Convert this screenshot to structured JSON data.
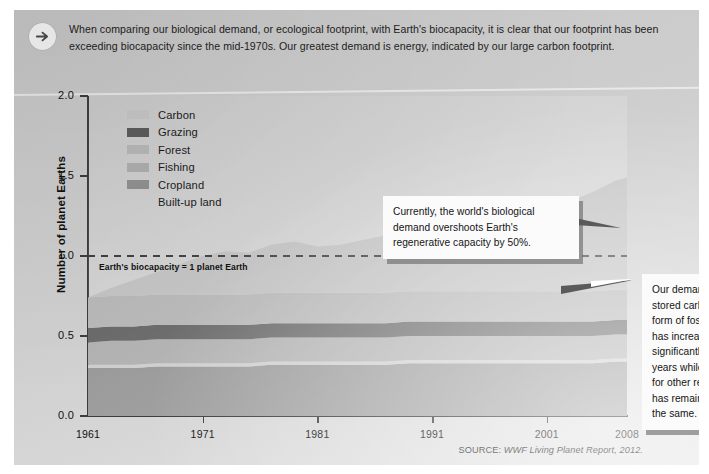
{
  "header": {
    "icon": "arrow-right-circle-icon",
    "text": "When comparing our biological demand, or ecological footprint, with Earth's biocapacity, it is clear that our footprint has been exceeding biocapacity since the mid-1970s. Our greatest demand is energy, indicated by our large carbon footprint."
  },
  "legend": {
    "items": [
      {
        "label": "Carbon",
        "color": "#bdbdbd",
        "has_swatch": true
      },
      {
        "label": "Grazing",
        "color": "#585858",
        "has_swatch": true
      },
      {
        "label": "Forest",
        "color": "#b0b0b0",
        "has_swatch": true
      },
      {
        "label": "Fishing",
        "color": "#a8a8a8",
        "has_swatch": true
      },
      {
        "label": "Cropland",
        "color": "#8c8c8c",
        "has_swatch": true
      },
      {
        "label": "Built-up land",
        "color": "#c8c8c8",
        "has_swatch": false
      }
    ]
  },
  "annotations": {
    "biocapacity_line": "Earth's biocapacity = 1 planet Earth",
    "callout_overshoot": "Currently, the world's biological demand overshoots Earth's regenerative capacity by 50%.",
    "callout_carbon": "Our demand on stored carbon in the form of fossil fuels has increased significantly in 47 years while demand for other resources has remained nearly the same."
  },
  "source": {
    "label": "SOURCE:",
    "title": "WWF Living Planet Report,",
    "year": "2012."
  },
  "chart_data": {
    "type": "area",
    "title": "",
    "xlabel": "",
    "ylabel": "Number of planet Earths",
    "xlim": [
      1961,
      2008
    ],
    "ylim": [
      0.0,
      2.0
    ],
    "ytick_labels": [
      "0.0",
      "0.5",
      "1.0",
      "1.5",
      "2.0"
    ],
    "ytick_values": [
      0.0,
      0.5,
      1.0,
      1.5,
      2.0
    ],
    "xtick_labels": [
      "1961",
      "1971",
      "1981",
      "1991",
      "2001",
      "2008"
    ],
    "xtick_values": [
      1961,
      1971,
      1981,
      1991,
      2001,
      2008
    ],
    "grid": false,
    "legend_position": "inside-top-left",
    "stacked": true,
    "reference_line": {
      "value": 1.0,
      "label": "Earth's biocapacity = 1 planet Earth",
      "style": "dashed"
    },
    "x": [
      1961,
      1963,
      1965,
      1967,
      1969,
      1971,
      1973,
      1975,
      1977,
      1979,
      1981,
      1983,
      1985,
      1987,
      1989,
      1991,
      1993,
      1995,
      1997,
      1999,
      2001,
      2003,
      2005,
      2007,
      2008
    ],
    "series": [
      {
        "name": "Cropland",
        "color": "#8c8c8c",
        "values": [
          0.3,
          0.3,
          0.3,
          0.31,
          0.31,
          0.31,
          0.31,
          0.31,
          0.32,
          0.32,
          0.32,
          0.32,
          0.32,
          0.32,
          0.33,
          0.33,
          0.33,
          0.33,
          0.33,
          0.33,
          0.33,
          0.33,
          0.33,
          0.34,
          0.34
        ]
      },
      {
        "name": "Built-up land",
        "color": "#c8c8c8",
        "values": [
          0.02,
          0.02,
          0.02,
          0.02,
          0.02,
          0.02,
          0.02,
          0.02,
          0.02,
          0.02,
          0.02,
          0.02,
          0.02,
          0.02,
          0.02,
          0.02,
          0.02,
          0.02,
          0.02,
          0.02,
          0.02,
          0.02,
          0.02,
          0.02,
          0.02
        ]
      },
      {
        "name": "Fishing",
        "color": "#a8a8a8",
        "values": [
          0.14,
          0.15,
          0.15,
          0.15,
          0.15,
          0.15,
          0.15,
          0.15,
          0.15,
          0.15,
          0.15,
          0.15,
          0.15,
          0.15,
          0.15,
          0.15,
          0.15,
          0.15,
          0.15,
          0.15,
          0.15,
          0.15,
          0.15,
          0.15,
          0.15
        ]
      },
      {
        "name": "Grazing",
        "color": "#585858",
        "values": [
          0.09,
          0.09,
          0.09,
          0.09,
          0.09,
          0.09,
          0.09,
          0.09,
          0.09,
          0.09,
          0.09,
          0.09,
          0.09,
          0.09,
          0.09,
          0.09,
          0.09,
          0.09,
          0.09,
          0.09,
          0.09,
          0.09,
          0.09,
          0.09,
          0.09
        ]
      },
      {
        "name": "Forest",
        "color": "#b0b0b0",
        "values": [
          0.19,
          0.19,
          0.19,
          0.19,
          0.19,
          0.19,
          0.19,
          0.19,
          0.19,
          0.19,
          0.19,
          0.19,
          0.19,
          0.19,
          0.19,
          0.19,
          0.19,
          0.19,
          0.19,
          0.19,
          0.19,
          0.19,
          0.19,
          0.19,
          0.19
        ]
      },
      {
        "name": "Carbon",
        "color": "#bdbdbd",
        "values": [
          0.0,
          0.05,
          0.1,
          0.14,
          0.19,
          0.24,
          0.27,
          0.26,
          0.3,
          0.32,
          0.29,
          0.3,
          0.33,
          0.36,
          0.38,
          0.36,
          0.38,
          0.42,
          0.46,
          0.48,
          0.5,
          0.56,
          0.62,
          0.68,
          0.7
        ]
      }
    ],
    "total_footprint": [
      0.74,
      0.8,
      0.85,
      0.9,
      0.95,
      1.0,
      1.03,
      1.02,
      1.07,
      1.09,
      1.07,
      1.08,
      1.11,
      1.14,
      1.17,
      1.15,
      1.17,
      1.21,
      1.25,
      1.27,
      1.29,
      1.35,
      1.41,
      1.48,
      1.5
    ]
  }
}
